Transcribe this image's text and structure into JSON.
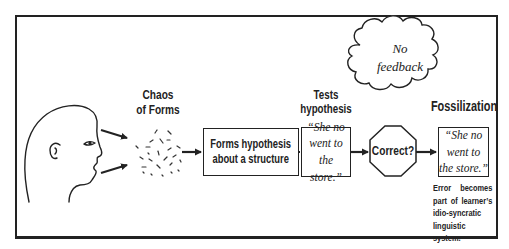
{
  "diagram": {
    "title_labels": {
      "chaos": "Chaos\nof Forms",
      "chaos_line1": "Chaos",
      "chaos_line2": "of Forms",
      "tests_line1": "Tests",
      "tests_line2": "hypothesis",
      "fossilization": "Fossilization"
    },
    "nodes": {
      "hypothesis_box": {
        "line1": "Forms hypothesis",
        "line2": "about a structure"
      },
      "test_quote": "“She no\nwent to\nthe store.”",
      "decision": "Correct?",
      "fossil_quote": "“She no\nwent to\nthe store.”"
    },
    "cloud": {
      "line1": "No",
      "line2": "feedback"
    },
    "caption": "Error becomes part of learner’s idio-syncratic linguistic system.",
    "flow": [
      "learner-head",
      "chaos-of-forms",
      "forms-hypothesis",
      "tests-hypothesis",
      "correct-decision",
      "fossilization"
    ],
    "colors": {
      "ink": "#222222",
      "background": "#ffffff"
    }
  }
}
